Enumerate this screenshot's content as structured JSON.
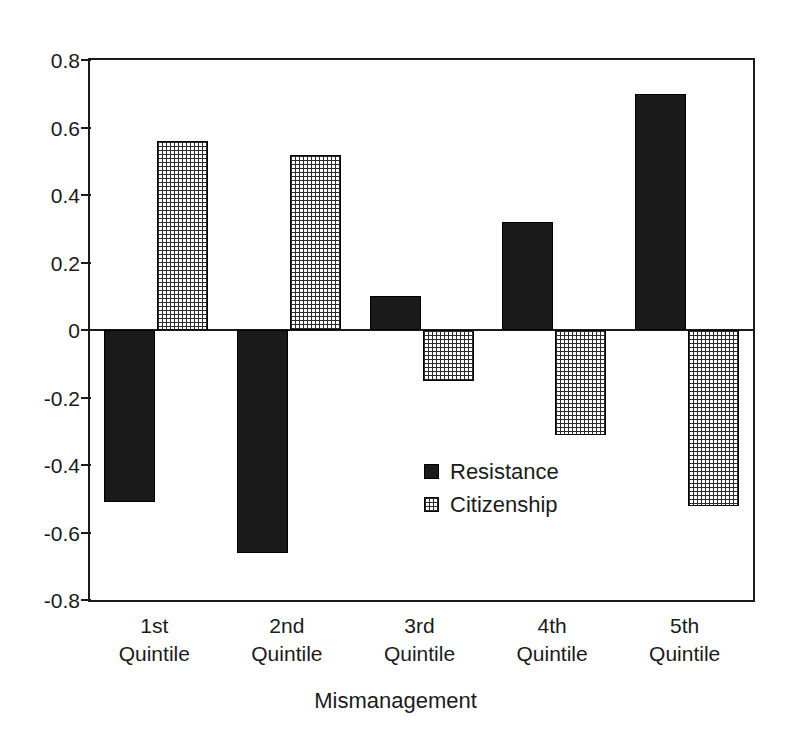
{
  "chart_data": {
    "type": "bar",
    "title": "",
    "xlabel": "Mismanagement",
    "ylabel": "",
    "categories": [
      "1st Quintile",
      "2nd Quintile",
      "3rd Quintile",
      "4th Quintile",
      "5th Quintile"
    ],
    "category_lines": [
      {
        "line1": "1st",
        "line2": "Quintile"
      },
      {
        "line1": "2nd",
        "line2": "Quintile"
      },
      {
        "line1": "3rd",
        "line2": "Quintile"
      },
      {
        "line1": "4th",
        "line2": "Quintile"
      },
      {
        "line1": "5th",
        "line2": "Quintile"
      }
    ],
    "series": [
      {
        "name": "Resistance",
        "fill": "solid-black",
        "color": "#1a1a1a",
        "values": [
          -0.51,
          -0.66,
          0.1,
          0.32,
          0.7
        ]
      },
      {
        "name": "Citizenship",
        "fill": "grid-hatch",
        "color": "#2b2b2b",
        "values": [
          0.56,
          0.52,
          -0.15,
          -0.31,
          -0.52
        ]
      }
    ],
    "ylim": [
      -0.8,
      0.8
    ],
    "ytick_labels": [
      "0.8",
      "0.6",
      "0.4",
      "0.2",
      "0",
      "-0.2",
      "-0.4",
      "-0.6",
      "-0.8"
    ],
    "ytick_values": [
      0.8,
      0.6,
      0.4,
      0.2,
      0,
      -0.2,
      -0.4,
      -0.6,
      -0.8
    ],
    "grid": false,
    "legend_position": "inside-center-lower",
    "legend_entries": [
      "Resistance",
      "Citizenship"
    ],
    "zero_baseline": true
  }
}
